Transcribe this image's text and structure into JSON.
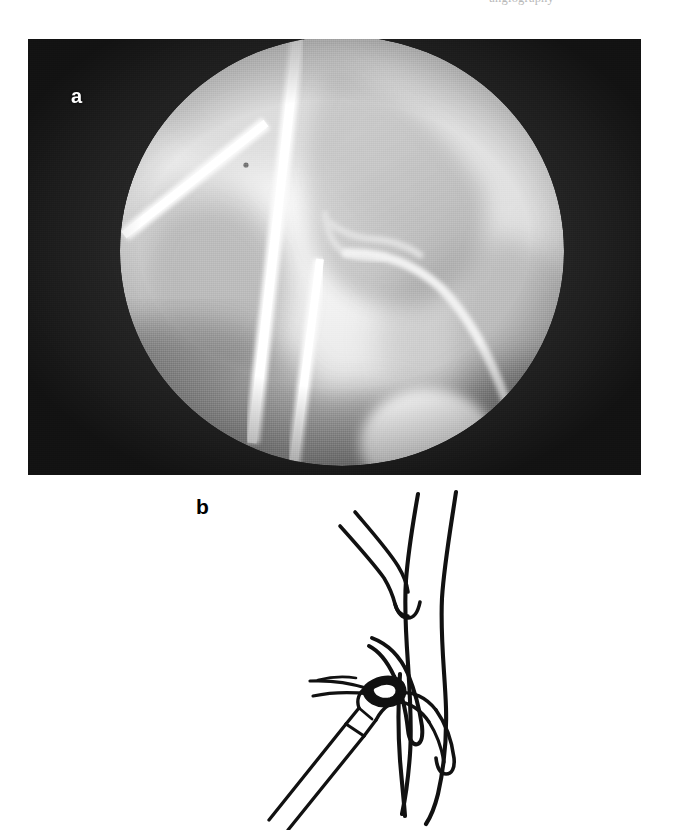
{
  "header": {
    "running_text": "angiography"
  },
  "figure": {
    "panels": [
      {
        "id": "a",
        "label": "a",
        "kind": "fluoroscopy-photograph",
        "description": "Dark rectangular fluoroscopic image with a bright circular field of view showing two radiopaque instrument shafts crossing over bone and a curved catheter within a vessel",
        "label_color": "#ffffff",
        "background_color": "#262626",
        "field_color": "#f0f0f0"
      },
      {
        "id": "b",
        "label": "b",
        "kind": "line-diagram",
        "description": "Schematic line drawing of a vessel bifurcation with a retrieval instrument grasping a catheter fragment",
        "label_color": "#000000",
        "stroke_color": "#111111",
        "background_color": "#ffffff"
      }
    ]
  }
}
